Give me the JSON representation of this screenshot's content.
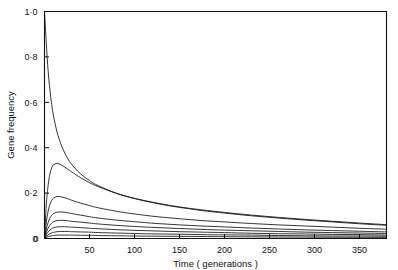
{
  "chart_data": {
    "type": "line",
    "title": "",
    "xlabel": "Time ( generations )",
    "ylabel": "Gene frequency",
    "xlim": [
      0,
      380
    ],
    "ylim": [
      0,
      1.0
    ],
    "grid": false,
    "legend": false,
    "xticks": [
      0,
      50,
      100,
      150,
      200,
      250,
      300,
      350
    ],
    "xtick_labels": [
      "0",
      "50",
      "100",
      "150",
      "200",
      "250",
      "300",
      "350"
    ],
    "yticks": [
      0,
      0.2,
      0.4,
      0.6,
      0.8,
      1.0
    ],
    "ytick_labels": [
      "0",
      "0·2",
      "0·4",
      "0·6",
      "0·8",
      "1·0"
    ],
    "x": [
      0,
      2,
      4,
      6,
      8,
      10,
      14,
      18,
      22,
      26,
      30,
      40,
      50,
      60,
      80,
      100,
      125,
      150,
      175,
      200,
      230,
      260,
      290,
      320,
      350,
      380
    ],
    "series": [
      {
        "name": "curve-1",
        "values": [
          1.0,
          0.86,
          0.74,
          0.655,
          0.59,
          0.54,
          0.468,
          0.418,
          0.381,
          0.351,
          0.327,
          0.285,
          0.255,
          0.232,
          0.199,
          0.176,
          0.154,
          0.137,
          0.123,
          0.112,
          0.1,
          0.09,
          0.081,
          0.073,
          0.065,
          0.058
        ]
      },
      {
        "name": "curve-2",
        "values": [
          0.0,
          0.148,
          0.234,
          0.284,
          0.311,
          0.325,
          0.331,
          0.325,
          0.316,
          0.305,
          0.294,
          0.268,
          0.246,
          0.228,
          0.199,
          0.177,
          0.156,
          0.139,
          0.126,
          0.115,
          0.103,
          0.093,
          0.084,
          0.076,
          0.068,
          0.061
        ]
      },
      {
        "name": "curve-3",
        "values": [
          0.0,
          0.072,
          0.12,
          0.15,
          0.168,
          0.178,
          0.185,
          0.184,
          0.18,
          0.175,
          0.169,
          0.156,
          0.145,
          0.135,
          0.12,
          0.108,
          0.096,
          0.087,
          0.079,
          0.073,
          0.066,
          0.06,
          0.055,
          0.05,
          0.045,
          0.041
        ]
      },
      {
        "name": "curve-4",
        "values": [
          0.0,
          0.041,
          0.07,
          0.09,
          0.102,
          0.11,
          0.116,
          0.117,
          0.116,
          0.113,
          0.11,
          0.103,
          0.096,
          0.09,
          0.081,
          0.074,
          0.066,
          0.06,
          0.055,
          0.051,
          0.046,
          0.042,
          0.038,
          0.035,
          0.032,
          0.029
        ]
      },
      {
        "name": "curve-5",
        "values": [
          0.0,
          0.026,
          0.045,
          0.059,
          0.068,
          0.074,
          0.079,
          0.08,
          0.08,
          0.078,
          0.076,
          0.072,
          0.068,
          0.064,
          0.058,
          0.053,
          0.048,
          0.044,
          0.04,
          0.037,
          0.034,
          0.031,
          0.028,
          0.026,
          0.024,
          0.022
        ]
      },
      {
        "name": "curve-6",
        "values": [
          0.0,
          0.016,
          0.028,
          0.037,
          0.043,
          0.047,
          0.051,
          0.052,
          0.052,
          0.051,
          0.05,
          0.048,
          0.045,
          0.043,
          0.039,
          0.036,
          0.033,
          0.03,
          0.028,
          0.026,
          0.023,
          0.021,
          0.02,
          0.018,
          0.017,
          0.015
        ]
      },
      {
        "name": "curve-7",
        "values": [
          0.0,
          0.009,
          0.016,
          0.021,
          0.025,
          0.027,
          0.03,
          0.031,
          0.031,
          0.031,
          0.03,
          0.029,
          0.028,
          0.026,
          0.024,
          0.022,
          0.02,
          0.019,
          0.017,
          0.016,
          0.015,
          0.013,
          0.012,
          0.011,
          0.011,
          0.01
        ]
      },
      {
        "name": "curve-8",
        "values": [
          0.0,
          0.004,
          0.008,
          0.01,
          0.012,
          0.013,
          0.015,
          0.015,
          0.015,
          0.015,
          0.015,
          0.014,
          0.014,
          0.013,
          0.012,
          0.011,
          0.01,
          0.0095,
          0.0087,
          0.008,
          0.0073,
          0.0067,
          0.0061,
          0.0056,
          0.0052,
          0.0048
        ]
      }
    ]
  },
  "figure": {
    "background_color": "#ffffff",
    "line_color": "#111111"
  }
}
